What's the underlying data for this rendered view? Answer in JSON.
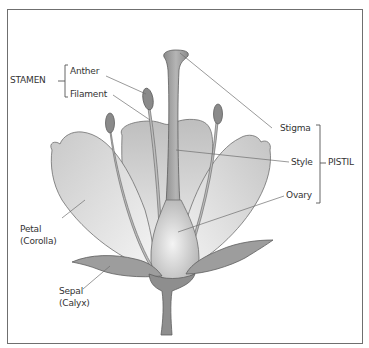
{
  "diagram": {
    "type": "flower-anatomy",
    "groups": {
      "stamen": {
        "label": "STAMEN",
        "parts": [
          "Anther",
          "Filament"
        ]
      },
      "pistil": {
        "label": "PISTIL",
        "parts": [
          "Stigma",
          "Style",
          "Ovary"
        ]
      }
    },
    "labels": {
      "stamen": "STAMEN",
      "anther": "Anther",
      "filament": "Filament",
      "stigma": "Stigma",
      "style": "Style",
      "pistil": "PISTIL",
      "ovary": "Ovary",
      "petal": "Petal",
      "petal_group": "(Corolla)",
      "sepal": "Sepal",
      "sepal_group": "(Calyx)"
    },
    "colors": {
      "outline": "#6f6f6f",
      "petal_light": "#f2f2f2",
      "petal_dark": "#bdbdbd",
      "sepal": "#9a9a9a",
      "stem": "#8e8e8e",
      "text": "#333333"
    }
  }
}
